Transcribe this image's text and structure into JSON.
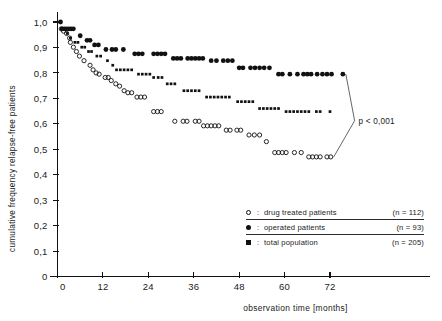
{
  "chart_data": {
    "type": "scatter",
    "title": "",
    "xlabel": "observation time [months]",
    "ylabel": "cumulative frequency relapse-free patients",
    "xlim": [
      0,
      78
    ],
    "ylim": [
      0,
      1.0
    ],
    "grid": false,
    "xticks": [
      0,
      12,
      24,
      36,
      48,
      60,
      72
    ],
    "xticklabels": [
      "0",
      "12",
      "24",
      "36",
      "48",
      "60",
      "72"
    ],
    "yticks": [
      0,
      0.1,
      0.2,
      0.3,
      0.4,
      0.5,
      0.6,
      0.7,
      0.8,
      0.9,
      1.0
    ],
    "yticklabels": [
      "0",
      "0,1",
      "0,2",
      "0,3",
      "0,4",
      "0,5",
      "0,6",
      "0,7",
      "0,8",
      "0,9",
      "1,0"
    ],
    "annotations": [
      {
        "text": "p < 0,001",
        "x": 78.5,
        "y": 0.612
      }
    ],
    "legend_position": "lower right",
    "series": [
      {
        "name": "drug treated patients",
        "n": 112,
        "marker": "open-circle",
        "color": "#111111",
        "points": [
          [
            1.0,
            0.973
          ],
          [
            1.6,
            0.964
          ],
          [
            2.4,
            0.955
          ],
          [
            3.2,
            0.937
          ],
          [
            3.4,
            0.92
          ],
          [
            4.2,
            0.901
          ],
          [
            5.0,
            0.884
          ],
          [
            5.8,
            0.866
          ],
          [
            7.0,
            0.848
          ],
          [
            8.6,
            0.83
          ],
          [
            9.4,
            0.812
          ],
          [
            10.2,
            0.8
          ],
          [
            11.0,
            0.795
          ],
          [
            12.6,
            0.782
          ],
          [
            13.4,
            0.782
          ],
          [
            14.2,
            0.77
          ],
          [
            15.4,
            0.757
          ],
          [
            16.4,
            0.748
          ],
          [
            17.6,
            0.73
          ],
          [
            18.6,
            0.722
          ],
          [
            19.6,
            0.722
          ],
          [
            21.0,
            0.705
          ],
          [
            22.0,
            0.705
          ],
          [
            23.0,
            0.705
          ],
          [
            25.4,
            0.648
          ],
          [
            26.4,
            0.648
          ],
          [
            27.4,
            0.648
          ],
          [
            31.0,
            0.61
          ],
          [
            33.2,
            0.61
          ],
          [
            34.2,
            0.61
          ],
          [
            36.4,
            0.61
          ],
          [
            37.4,
            0.61
          ],
          [
            38.6,
            0.592
          ],
          [
            39.6,
            0.592
          ],
          [
            40.6,
            0.592
          ],
          [
            41.6,
            0.592
          ],
          [
            42.6,
            0.592
          ],
          [
            44.6,
            0.575
          ],
          [
            45.6,
            0.575
          ],
          [
            47.4,
            0.575
          ],
          [
            48.4,
            0.575
          ],
          [
            50.6,
            0.556
          ],
          [
            52.0,
            0.556
          ],
          [
            53.4,
            0.556
          ],
          [
            55.2,
            0.53
          ],
          [
            57.4,
            0.487
          ],
          [
            58.4,
            0.487
          ],
          [
            59.4,
            0.487
          ],
          [
            60.4,
            0.487
          ],
          [
            62.6,
            0.487
          ],
          [
            64.4,
            0.487
          ],
          [
            66.4,
            0.47
          ],
          [
            67.4,
            0.47
          ],
          [
            68.4,
            0.47
          ],
          [
            69.4,
            0.47
          ],
          [
            71.2,
            0.47
          ],
          [
            72.2,
            0.47
          ]
        ]
      },
      {
        "name": "operated patients",
        "n": 93,
        "marker": "filled-circle",
        "color": "#111111",
        "points": [
          [
            0.8,
            1.0
          ],
          [
            1.2,
            0.973
          ],
          [
            1.8,
            0.973
          ],
          [
            2.4,
            0.973
          ],
          [
            3.0,
            0.973
          ],
          [
            3.6,
            0.973
          ],
          [
            4.2,
            0.973
          ],
          [
            6.0,
            0.946
          ],
          [
            7.8,
            0.928
          ],
          [
            8.6,
            0.928
          ],
          [
            9.8,
            0.91
          ],
          [
            10.8,
            0.91
          ],
          [
            12.8,
            0.892
          ],
          [
            14.4,
            0.892
          ],
          [
            15.4,
            0.892
          ],
          [
            17.4,
            0.892
          ],
          [
            20.4,
            0.875
          ],
          [
            21.4,
            0.875
          ],
          [
            22.4,
            0.875
          ],
          [
            25.4,
            0.875
          ],
          [
            26.4,
            0.875
          ],
          [
            27.4,
            0.875
          ],
          [
            28.4,
            0.875
          ],
          [
            30.6,
            0.857
          ],
          [
            31.6,
            0.857
          ],
          [
            32.6,
            0.857
          ],
          [
            34.4,
            0.857
          ],
          [
            35.4,
            0.857
          ],
          [
            36.4,
            0.857
          ],
          [
            37.4,
            0.857
          ],
          [
            38.4,
            0.857
          ],
          [
            40.6,
            0.848
          ],
          [
            42.0,
            0.848
          ],
          [
            43.8,
            0.848
          ],
          [
            45.0,
            0.848
          ],
          [
            46.2,
            0.848
          ],
          [
            48.0,
            0.82
          ],
          [
            49.0,
            0.82
          ],
          [
            51.0,
            0.82
          ],
          [
            52.2,
            0.82
          ],
          [
            53.4,
            0.82
          ],
          [
            54.6,
            0.82
          ],
          [
            56.0,
            0.82
          ],
          [
            58.4,
            0.795
          ],
          [
            59.4,
            0.795
          ],
          [
            61.4,
            0.795
          ],
          [
            63.4,
            0.795
          ],
          [
            65.0,
            0.795
          ],
          [
            66.0,
            0.795
          ],
          [
            67.0,
            0.795
          ],
          [
            68.6,
            0.795
          ],
          [
            70.0,
            0.795
          ],
          [
            71.2,
            0.795
          ],
          [
            72.4,
            0.795
          ],
          [
            75.4,
            0.795
          ]
        ]
      },
      {
        "name": "total population",
        "n": 205,
        "marker": "cross",
        "color": "#111111",
        "points": [
          [
            2.6,
            0.955
          ],
          [
            3.4,
            0.937
          ],
          [
            4.6,
            0.92
          ],
          [
            5.4,
            0.92
          ],
          [
            6.4,
            0.901
          ],
          [
            7.2,
            0.901
          ],
          [
            8.2,
            0.884
          ],
          [
            9.0,
            0.884
          ],
          [
            10.4,
            0.866
          ],
          [
            11.4,
            0.866
          ],
          [
            13.2,
            0.848
          ],
          [
            14.6,
            0.83
          ],
          [
            15.6,
            0.812
          ],
          [
            16.6,
            0.812
          ],
          [
            17.6,
            0.812
          ],
          [
            18.6,
            0.812
          ],
          [
            19.6,
            0.812
          ],
          [
            21.4,
            0.795
          ],
          [
            22.4,
            0.795
          ],
          [
            23.4,
            0.795
          ],
          [
            24.4,
            0.795
          ],
          [
            25.4,
            0.782
          ],
          [
            26.6,
            0.782
          ],
          [
            27.6,
            0.782
          ],
          [
            29.0,
            0.757
          ],
          [
            30.0,
            0.757
          ],
          [
            31.0,
            0.757
          ],
          [
            33.4,
            0.73
          ],
          [
            34.4,
            0.73
          ],
          [
            35.4,
            0.73
          ],
          [
            36.4,
            0.73
          ],
          [
            37.4,
            0.73
          ],
          [
            39.4,
            0.705
          ],
          [
            40.4,
            0.705
          ],
          [
            41.4,
            0.705
          ],
          [
            42.4,
            0.705
          ],
          [
            43.4,
            0.705
          ],
          [
            44.4,
            0.705
          ],
          [
            45.4,
            0.705
          ],
          [
            47.6,
            0.687
          ],
          [
            48.6,
            0.687
          ],
          [
            49.6,
            0.687
          ],
          [
            50.6,
            0.687
          ],
          [
            51.6,
            0.687
          ],
          [
            53.4,
            0.66
          ],
          [
            54.4,
            0.66
          ],
          [
            55.4,
            0.66
          ],
          [
            56.4,
            0.66
          ],
          [
            57.4,
            0.66
          ],
          [
            58.4,
            0.66
          ],
          [
            60.4,
            0.648
          ],
          [
            61.4,
            0.648
          ],
          [
            62.4,
            0.648
          ],
          [
            63.4,
            0.648
          ],
          [
            64.4,
            0.648
          ],
          [
            65.4,
            0.648
          ],
          [
            66.4,
            0.648
          ],
          [
            68.4,
            0.648
          ],
          [
            69.4,
            0.648
          ],
          [
            72.0,
            0.648
          ]
        ]
      }
    ]
  },
  "axes": {
    "y_label": "cumulative frequency relapse-free patients",
    "x_label": "observation time [months]"
  },
  "legend": {
    "rows": [
      {
        "marker": "open-circle",
        "eq": ":",
        "label": "drug treated patients",
        "n_text": "(n = 112)"
      },
      {
        "marker": "filled-circle",
        "eq": ":",
        "label": "operated patients",
        "n_text": "(n =  93)"
      },
      {
        "marker": "cross",
        "eq": ":",
        "label": "total population",
        "n_text": "(n = 205)"
      }
    ]
  },
  "annotation": {
    "p_value": "p < 0,001"
  }
}
